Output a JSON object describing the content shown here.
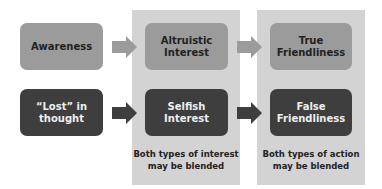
{
  "diagram": {
    "rows": [
      {
        "kind": "top",
        "nodes": [
          "Awareness",
          "Altruistic\nInterest",
          "True\nFriendliness"
        ]
      },
      {
        "kind": "bottom",
        "nodes": [
          "“Lost” in\nthought",
          "Selfish\nInterest",
          "False\nFriendliness"
        ]
      }
    ],
    "nodes": {
      "awareness": "Awareness",
      "lost_line1": "“Lost” in",
      "lost_line2": "thought",
      "altruistic_line1": "Altruistic",
      "altruistic_line2": "Interest",
      "selfish_line1": "Selfish",
      "selfish_line2": "Interest",
      "true_line1": "True",
      "true_line2": "Friendliness",
      "false_line1": "False",
      "false_line2": "Friendliness"
    },
    "panels": {
      "interest_note_line1": "Both types of interest",
      "interest_note_line2": "may be blended",
      "action_note_line1": "Both types of action",
      "action_note_line2": "may be blended"
    },
    "colors": {
      "panel": "#d3d3d3",
      "top_row": "#9b9b9b",
      "bottom_row": "#3e3e3e",
      "top_arrow": "#9b9b9b",
      "bottom_arrow": "#3e3e3e"
    },
    "edges": [
      {
        "from": "Awareness",
        "to": "Altruistic Interest"
      },
      {
        "from": "Altruistic Interest",
        "to": "True Friendliness"
      },
      {
        "from": "“Lost” in thought",
        "to": "Selfish Interest"
      },
      {
        "from": "Selfish Interest",
        "to": "False Friendliness"
      }
    ]
  }
}
